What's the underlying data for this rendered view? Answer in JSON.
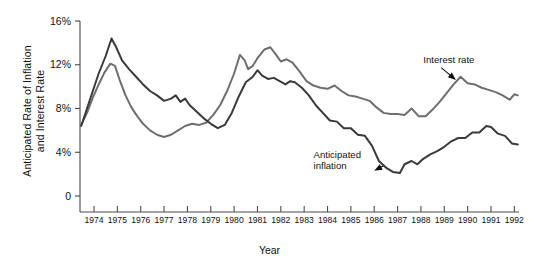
{
  "chart_data": {
    "type": "line",
    "title": "",
    "xlabel": "Year",
    "ylabel": "Anticipated Rate of Inflation\nand Interest Rate",
    "ylim": [
      0,
      16
    ],
    "xlim": [
      1973.4,
      1992.2
    ],
    "grid": false,
    "legend_position": "inline-annotations",
    "y_ticks": [
      "0",
      "4%",
      "8%",
      "12%",
      "16%"
    ],
    "y_tick_values": [
      0,
      4,
      8,
      12,
      16
    ],
    "x_ticks": [
      "1974",
      "1975",
      "1976",
      "1977",
      "1978",
      "1979",
      "1980",
      "1981",
      "1982",
      "1983",
      "1984",
      "1985",
      "1986",
      "1987",
      "1988",
      "1989",
      "1990",
      "1991",
      "1992"
    ],
    "x_tick_values": [
      1974,
      1975,
      1976,
      1977,
      1978,
      1979,
      1980,
      1981,
      1982,
      1983,
      1984,
      1985,
      1986,
      1987,
      1988,
      1989,
      1990,
      1991,
      1992
    ],
    "annotations": [
      {
        "text": "Interest rate",
        "x": 1988.1,
        "y": 12.2,
        "target_x": 1989.5,
        "target_y": 10.6
      },
      {
        "text": "Anticipated\ninflation",
        "x": 1983.4,
        "y": 3.5,
        "target_x": 1986.0,
        "target_y": 2.3
      }
    ],
    "series": [
      {
        "name": "Interest rate",
        "color": "#6e6e6e",
        "points": [
          [
            1973.45,
            6.5
          ],
          [
            1973.7,
            7.6
          ],
          [
            1973.95,
            9.0
          ],
          [
            1974.2,
            10.2
          ],
          [
            1974.45,
            11.3
          ],
          [
            1974.7,
            12.1
          ],
          [
            1974.9,
            11.9
          ],
          [
            1975.1,
            10.6
          ],
          [
            1975.35,
            9.2
          ],
          [
            1975.6,
            8.1
          ],
          [
            1975.85,
            7.3
          ],
          [
            1976.1,
            6.6
          ],
          [
            1976.4,
            6.0
          ],
          [
            1976.7,
            5.6
          ],
          [
            1977.0,
            5.4
          ],
          [
            1977.3,
            5.6
          ],
          [
            1977.6,
            6.0
          ],
          [
            1977.9,
            6.4
          ],
          [
            1978.2,
            6.6
          ],
          [
            1978.5,
            6.5
          ],
          [
            1978.8,
            6.7
          ],
          [
            1979.1,
            7.4
          ],
          [
            1979.4,
            8.3
          ],
          [
            1979.7,
            9.6
          ],
          [
            1980.0,
            11.2
          ],
          [
            1980.25,
            12.9
          ],
          [
            1980.45,
            12.4
          ],
          [
            1980.6,
            11.6
          ],
          [
            1980.8,
            11.9
          ],
          [
            1981.0,
            12.6
          ],
          [
            1981.3,
            13.4
          ],
          [
            1981.55,
            13.6
          ],
          [
            1981.8,
            12.9
          ],
          [
            1982.0,
            12.3
          ],
          [
            1982.25,
            12.5
          ],
          [
            1982.5,
            12.2
          ],
          [
            1982.8,
            11.4
          ],
          [
            1983.1,
            10.5
          ],
          [
            1983.4,
            10.1
          ],
          [
            1983.7,
            9.9
          ],
          [
            1984.0,
            9.8
          ],
          [
            1984.3,
            10.1
          ],
          [
            1984.6,
            9.6
          ],
          [
            1984.9,
            9.2
          ],
          [
            1985.2,
            9.1
          ],
          [
            1985.5,
            8.9
          ],
          [
            1985.8,
            8.7
          ],
          [
            1986.1,
            8.1
          ],
          [
            1986.4,
            7.6
          ],
          [
            1986.7,
            7.5
          ],
          [
            1987.0,
            7.5
          ],
          [
            1987.3,
            7.4
          ],
          [
            1987.6,
            8.0
          ],
          [
            1987.9,
            7.3
          ],
          [
            1988.2,
            7.3
          ],
          [
            1988.5,
            7.9
          ],
          [
            1988.8,
            8.6
          ],
          [
            1989.1,
            9.4
          ],
          [
            1989.4,
            10.2
          ],
          [
            1989.7,
            10.9
          ],
          [
            1990.0,
            10.3
          ],
          [
            1990.3,
            10.2
          ],
          [
            1990.6,
            9.9
          ],
          [
            1990.9,
            9.7
          ],
          [
            1991.2,
            9.5
          ],
          [
            1991.5,
            9.2
          ],
          [
            1991.8,
            8.8
          ],
          [
            1992.0,
            9.3
          ],
          [
            1992.15,
            9.2
          ]
        ]
      },
      {
        "name": "Anticipated inflation",
        "color": "#3a3a3a",
        "points": [
          [
            1973.45,
            6.4
          ],
          [
            1973.7,
            8.0
          ],
          [
            1973.95,
            9.6
          ],
          [
            1974.2,
            11.2
          ],
          [
            1974.5,
            12.8
          ],
          [
            1974.75,
            14.4
          ],
          [
            1974.95,
            13.6
          ],
          [
            1975.2,
            12.4
          ],
          [
            1975.5,
            11.6
          ],
          [
            1975.8,
            10.9
          ],
          [
            1976.1,
            10.2
          ],
          [
            1976.4,
            9.6
          ],
          [
            1976.7,
            9.2
          ],
          [
            1977.0,
            8.7
          ],
          [
            1977.3,
            8.9
          ],
          [
            1977.5,
            9.2
          ],
          [
            1977.7,
            8.6
          ],
          [
            1977.9,
            8.9
          ],
          [
            1978.1,
            8.3
          ],
          [
            1978.4,
            7.7
          ],
          [
            1978.7,
            7.1
          ],
          [
            1979.0,
            6.6
          ],
          [
            1979.3,
            6.2
          ],
          [
            1979.6,
            6.5
          ],
          [
            1979.9,
            7.6
          ],
          [
            1980.2,
            9.1
          ],
          [
            1980.5,
            10.4
          ],
          [
            1980.8,
            10.9
          ],
          [
            1981.0,
            11.5
          ],
          [
            1981.2,
            11.0
          ],
          [
            1981.45,
            10.7
          ],
          [
            1981.7,
            10.8
          ],
          [
            1981.95,
            10.5
          ],
          [
            1982.2,
            10.2
          ],
          [
            1982.4,
            10.5
          ],
          [
            1982.6,
            10.4
          ],
          [
            1982.9,
            9.9
          ],
          [
            1983.2,
            9.2
          ],
          [
            1983.5,
            8.3
          ],
          [
            1983.8,
            7.6
          ],
          [
            1984.1,
            6.9
          ],
          [
            1984.4,
            6.8
          ],
          [
            1984.7,
            6.2
          ],
          [
            1985.0,
            6.2
          ],
          [
            1985.3,
            5.6
          ],
          [
            1985.6,
            5.5
          ],
          [
            1985.9,
            4.6
          ],
          [
            1986.2,
            3.2
          ],
          [
            1986.5,
            2.6
          ],
          [
            1986.8,
            2.2
          ],
          [
            1987.1,
            2.1
          ],
          [
            1987.3,
            2.9
          ],
          [
            1987.6,
            3.2
          ],
          [
            1987.85,
            2.9
          ],
          [
            1988.1,
            3.4
          ],
          [
            1988.4,
            3.8
          ],
          [
            1988.7,
            4.1
          ],
          [
            1989.0,
            4.5
          ],
          [
            1989.3,
            5.0
          ],
          [
            1989.6,
            5.3
          ],
          [
            1989.9,
            5.3
          ],
          [
            1990.2,
            5.8
          ],
          [
            1990.5,
            5.8
          ],
          [
            1990.8,
            6.4
          ],
          [
            1991.0,
            6.3
          ],
          [
            1991.3,
            5.7
          ],
          [
            1991.6,
            5.5
          ],
          [
            1991.9,
            4.8
          ],
          [
            1992.15,
            4.7
          ]
        ]
      }
    ]
  }
}
